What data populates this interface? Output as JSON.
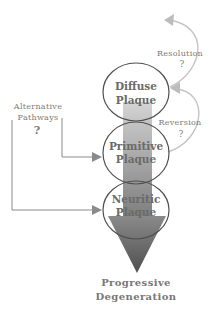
{
  "diagram": {
    "nodes": [
      {
        "id": "diffuse",
        "line1": "Diffuse",
        "line2": "Plaque"
      },
      {
        "id": "primitive",
        "line1": "Primitive",
        "line2": "Plaque"
      },
      {
        "id": "neuritic",
        "line1": "Neuritic",
        "line2": "Plaque"
      }
    ],
    "outcome": {
      "line1": "Progressive",
      "line2": "Degeneration"
    },
    "resolution": {
      "label": "Resolution",
      "mark": "?"
    },
    "reversion": {
      "label": "Reversion",
      "mark": "?"
    },
    "alternative": {
      "line1": "Alternative",
      "line2": "Pathways",
      "mark": "?"
    },
    "colors": {
      "arrow_dark": "#5e5e5e",
      "arrow_light": "#bdbdbd",
      "outline": "#555555",
      "curve": "#bfbfbf",
      "connector": "#8a8a8a",
      "text": "#707070"
    }
  }
}
